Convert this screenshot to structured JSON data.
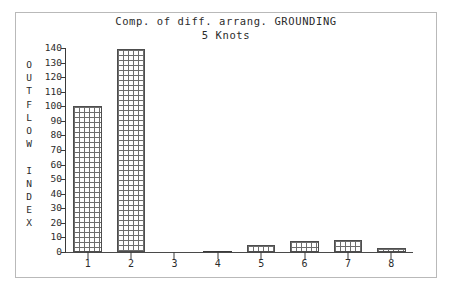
{
  "chart_data": {
    "type": "bar",
    "title": "Comp. of diff. arrang. GROUNDING",
    "subtitle": "5 Knots",
    "xlabel": "",
    "ylabel": "OUTFLOW INDEX",
    "ylabel_lines": [
      "O",
      "U",
      "T",
      "F",
      "L",
      "O",
      "W",
      "",
      "I",
      "N",
      "D",
      "E",
      "X"
    ],
    "categories": [
      "1",
      "2",
      "3",
      "4",
      "5",
      "6",
      "7",
      "8"
    ],
    "values": [
      100,
      139,
      0,
      1,
      5,
      7.5,
      8.5,
      3
    ],
    "ylim": [
      0,
      140
    ],
    "yticks": [
      0,
      10,
      20,
      30,
      40,
      50,
      60,
      70,
      80,
      90,
      100,
      110,
      120,
      130,
      140
    ],
    "ytick_labels": [
      "0",
      "10",
      "20",
      "30",
      "40",
      "50",
      "60",
      "70",
      "80",
      "90",
      "100",
      "110",
      "120",
      "130",
      "140"
    ],
    "grid": false,
    "legend": null,
    "bar_fill": "cross-hatch grid",
    "colors": {
      "axis": "#3a3a3a",
      "bar_edge": "#4d4d4d",
      "bar_hatch": "#6e6e6e",
      "text": "#2b2b2b",
      "frame": "#b9b9b9",
      "background": "#ffffff"
    }
  }
}
